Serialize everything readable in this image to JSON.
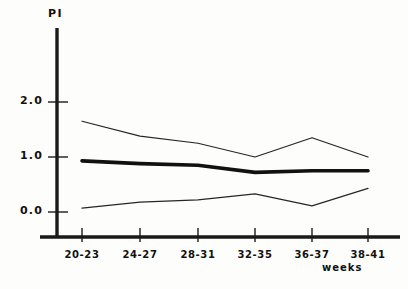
{
  "chart_data": {
    "type": "line",
    "title": "",
    "subtitle": "",
    "xlabel": "weeks",
    "ylabel": "PI",
    "categories": [
      "20-23",
      "24-27",
      "28-31",
      "32-35",
      "36-37",
      "38-41"
    ],
    "yticks": [
      "0.0",
      "1.0",
      "2.0"
    ],
    "ytick_values": [
      0.0,
      1.0,
      2.0
    ],
    "ylim": [
      -0.45,
      2.55
    ],
    "xlim": [
      -0.55,
      5.55
    ],
    "grid": false,
    "legend": "none",
    "series": [
      {
        "name": "upper-percentile",
        "style": "thin",
        "color": "#262626",
        "values": [
          1.65,
          1.38,
          1.25,
          1.0,
          1.35,
          1.0
        ]
      },
      {
        "name": "median",
        "style": "thick",
        "color": "#111111",
        "values": [
          0.93,
          0.88,
          0.85,
          0.72,
          0.75,
          0.75
        ]
      },
      {
        "name": "lower-percentile",
        "style": "thin",
        "color": "#262626",
        "values": [
          0.07,
          0.18,
          0.22,
          0.33,
          0.11,
          0.43
        ]
      }
    ]
  }
}
